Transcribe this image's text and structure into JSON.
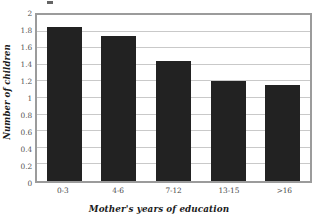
{
  "chart_data": {
    "type": "bar",
    "title": "",
    "xlabel": "Mother's years of education",
    "ylabel": "Number of children",
    "categories": [
      "0-3",
      "4-6",
      "7-12",
      "13-15",
      ">16"
    ],
    "values": [
      1.86,
      1.75,
      1.45,
      1.21,
      1.16
    ],
    "series": [
      {
        "name": "Number of children",
        "values": [
          1.86,
          1.75,
          1.45,
          1.21,
          1.16
        ]
      }
    ],
    "ylim": [
      0,
      2
    ],
    "ytick_labels": [
      "0",
      "0.2",
      "0.4",
      "0.6",
      "0.8",
      "1",
      "1.2",
      "1.4",
      "1.6",
      "1.8",
      "2"
    ],
    "ytick_values": [
      0,
      0.2,
      0.4,
      0.6,
      0.8,
      1,
      1.2,
      1.4,
      1.6,
      1.8,
      2
    ],
    "grid": true,
    "grid_axis": "y",
    "legend": false,
    "legend_position": "none",
    "bar_color": "#222222",
    "grid_color": "#c9c9c9",
    "frame_color": "#9b9b9b",
    "background_color": "#ffffff",
    "annotations": []
  }
}
